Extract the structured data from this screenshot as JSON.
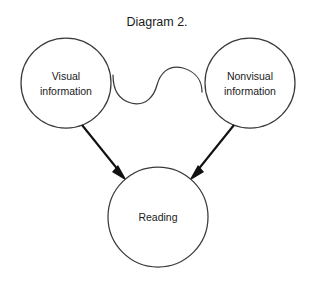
{
  "figure": {
    "title": "Diagram 2.",
    "background_color": "#ffffff",
    "stroke_color": "#3a3a3a",
    "arrow_color": "#111111",
    "text_color": "#1a1a1a"
  },
  "nodes": {
    "visual": {
      "line1": "Visual",
      "line2": "information"
    },
    "nonvisual": {
      "line1": "Nonvisual",
      "line2": "information"
    },
    "reading": {
      "line1": "Reading"
    }
  },
  "connectors": {
    "wavy": {
      "label": "",
      "style": "s-curve",
      "from": "visual",
      "to": "nonvisual"
    },
    "arrow_left": {
      "label": "",
      "style": "straight-arrow",
      "from": "visual",
      "to": "reading"
    },
    "arrow_right": {
      "label": "",
      "style": "straight-arrow",
      "from": "nonvisual",
      "to": "reading"
    }
  }
}
